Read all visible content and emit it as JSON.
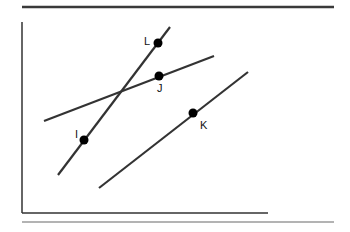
{
  "diagram": {
    "colors": {
      "line": "#333333",
      "point": "#000000",
      "rule_top": "#3a3a3a",
      "rule_bottom": "#9a9a9a",
      "frame": "#333333"
    },
    "points": [
      {
        "label": "L",
        "x": 158,
        "y": 43
      },
      {
        "label": "J",
        "x": 159,
        "y": 76
      },
      {
        "label": "I",
        "x": 84,
        "y": 140
      },
      {
        "label": "K",
        "x": 193,
        "y": 113
      }
    ],
    "lines": [
      {
        "name": "line-IL",
        "through": [
          "I",
          "L"
        ]
      },
      {
        "name": "line-J",
        "through": [
          "J"
        ]
      },
      {
        "name": "line-K",
        "through": [
          "K"
        ]
      }
    ]
  },
  "labels": {
    "L": "L",
    "J": "J",
    "I": "I",
    "K": "K"
  }
}
